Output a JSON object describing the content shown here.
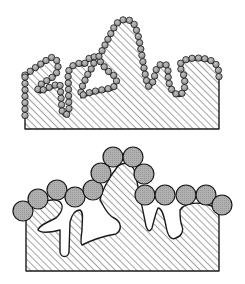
{
  "figure": {
    "panels": [
      {
        "id": "top",
        "description": "Hatched substrate with rough, re-entrant surface coated by small spheres conforming to every pore",
        "sphere_size": "small",
        "sphere_radius_px": 3.2
      },
      {
        "id": "bottom",
        "description": "Same rough substrate with large spheres bridging over pores, leaving open voids",
        "sphere_size": "large",
        "sphere_radius_px": 10
      }
    ],
    "colors": {
      "outline": "#1a1a1a",
      "hatch": "#333333",
      "sphere_fill": "#a8a8a8",
      "background": "#ffffff"
    }
  }
}
